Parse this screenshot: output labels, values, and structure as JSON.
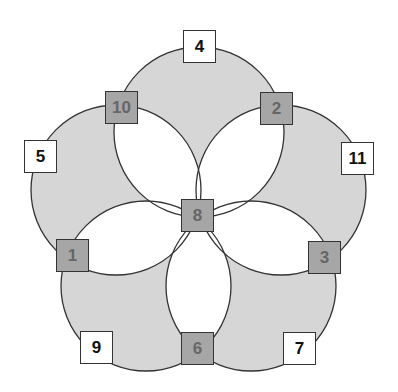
{
  "diagram": {
    "type": "five-circle flower puzzle",
    "colors": {
      "circle_fill": "#d6d6d6",
      "circle_stroke": "#333333",
      "gray_box_fill": "#a6a6a6",
      "gray_box_text": "#666666",
      "white_box_fill": "#ffffff",
      "white_box_text": "#111111"
    },
    "circles": [
      {
        "cx": 199,
        "cy": 132,
        "r": 85
      },
      {
        "cx": 281,
        "cy": 190,
        "r": 85
      },
      {
        "cx": 251,
        "cy": 286,
        "r": 85
      },
      {
        "cx": 146,
        "cy": 286,
        "r": 85
      },
      {
        "cx": 116,
        "cy": 190,
        "r": 85
      }
    ],
    "boxes": [
      {
        "label": "4",
        "style": "white",
        "x": 183,
        "y": 30
      },
      {
        "label": "10",
        "style": "gray",
        "x": 105,
        "y": 91
      },
      {
        "label": "2",
        "style": "gray",
        "x": 260,
        "y": 92
      },
      {
        "label": "5",
        "style": "white",
        "x": 24,
        "y": 140
      },
      {
        "label": "11",
        "style": "white",
        "x": 341,
        "y": 142
      },
      {
        "label": "8",
        "style": "gray",
        "x": 181,
        "y": 199
      },
      {
        "label": "1",
        "style": "gray",
        "x": 56,
        "y": 239
      },
      {
        "label": "3",
        "style": "gray",
        "x": 308,
        "y": 241
      },
      {
        "label": "9",
        "style": "white",
        "x": 80,
        "y": 331
      },
      {
        "label": "6",
        "style": "gray",
        "x": 181,
        "y": 332
      },
      {
        "label": "7",
        "style": "white",
        "x": 283,
        "y": 332
      }
    ]
  }
}
